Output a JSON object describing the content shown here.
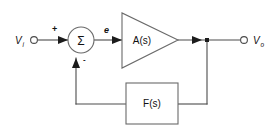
{
  "diagram": {
    "background_color": "#ffffff",
    "line_color": "#4c4c4c",
    "shape_color": "#6a6a6a",
    "text_color": "#111111",
    "nodes": {
      "input_terminal": {
        "label_main": "V",
        "label_sub": "i",
        "name": "input-terminal"
      },
      "output_terminal": {
        "label_main": "V",
        "label_sub": "o",
        "name": "output-terminal"
      },
      "summing_junction": {
        "symbol": "Σ",
        "plus_sign": "+",
        "minus_sign": "-"
      },
      "error_signal": {
        "label": "e"
      },
      "forward_block": {
        "label": "A(s)"
      },
      "feedback_block": {
        "label": "F(s)"
      }
    }
  }
}
